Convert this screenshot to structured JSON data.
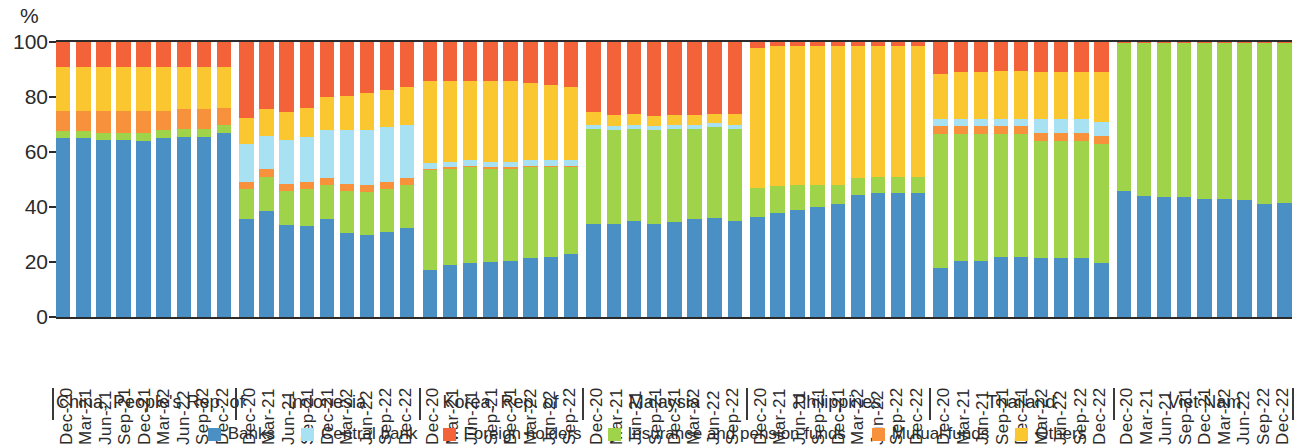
{
  "axis": {
    "unit_label": "%",
    "y_ticks": [
      0,
      20,
      40,
      60,
      80,
      100
    ],
    "y_min": 0,
    "y_max": 100
  },
  "legend": {
    "items": [
      {
        "label": "Banks",
        "color": "#4a90c4"
      },
      {
        "label": "Central bank",
        "color": "#a8e2f2"
      },
      {
        "label": "Foreign holders",
        "color": "#f4623a"
      },
      {
        "label": "Insurance and pension funds",
        "color": "#9ed34a"
      },
      {
        "label": "Mutual funds",
        "color": "#f7913c"
      },
      {
        "label": "Others",
        "color": "#fbc730"
      }
    ]
  },
  "chart_data": {
    "type": "bar",
    "subtype": "stacked-100-percent",
    "title": "",
    "xlabel": "",
    "ylabel": "%",
    "ylim": [
      0,
      100
    ],
    "grid": false,
    "legend_position": "bottom",
    "series_order": [
      "Banks",
      "Insurance and pension funds",
      "Mutual funds",
      "Central bank",
      "Others",
      "Foreign holders"
    ],
    "series_colors": {
      "Banks": "#4a90c4",
      "Central bank": "#a8e2f2",
      "Foreign holders": "#f4623a",
      "Insurance and pension funds": "#9ed34a",
      "Mutual funds": "#f7913c",
      "Others": "#fbc730"
    },
    "panels": [
      {
        "name": "China, People's Rep. of",
        "categories": [
          "Dec-20",
          "Mar-21",
          "Jun-21",
          "Sep-21",
          "Dec-21",
          "Mar-22",
          "Jun-22",
          "Sep-22",
          "Dec-22"
        ],
        "series": [
          {
            "name": "Banks",
            "values": [
              65.0,
              65.0,
              64.5,
              64.5,
              64.0,
              65.0,
              65.5,
              65.5,
              67.0
            ]
          },
          {
            "name": "Insurance and pension funds",
            "values": [
              2.5,
              2.5,
              2.5,
              2.5,
              3.0,
              3.0,
              3.0,
              3.0,
              3.0
            ]
          },
          {
            "name": "Mutual funds",
            "values": [
              0,
              0,
              0,
              0,
              0,
              0,
              0,
              0,
              0
            ]
          },
          {
            "name": "Central bank",
            "values": [
              0,
              0,
              0,
              0,
              0,
              0,
              0,
              0,
              0
            ]
          },
          {
            "name": "Others",
            "values": [
              0,
              0,
              0,
              0,
              0,
              0,
              0,
              0,
              0
            ]
          },
          {
            "name": "Foreign holders",
            "values": [
              32.5,
              32.5,
              33.0,
              33.0,
              33.0,
              32.0,
              31.5,
              31.5,
              30.0
            ]
          }
        ],
        "composite_segments": [
          {
            "name": "Banks",
            "values": [
              65.0,
              65.0,
              64.5,
              64.5,
              64.0,
              65.0,
              65.5,
              65.5,
              67.0
            ]
          },
          {
            "name": "Insurance and pension funds",
            "values": [
              2.5,
              2.5,
              2.5,
              2.5,
              3.0,
              3.0,
              3.0,
              3.0,
              3.0
            ]
          },
          {
            "name": "Mutual funds",
            "values": [
              7.5,
              7.5,
              8.0,
              8.0,
              8.0,
              7.0,
              7.0,
              7.0,
              6.0
            ]
          },
          {
            "name": "Others",
            "values": [
              16.0,
              16.0,
              16.0,
              16.0,
              16.0,
              16.0,
              15.5,
              15.5,
              15.0
            ]
          },
          {
            "name": "Foreign holders",
            "values": [
              9.0,
              9.0,
              9.0,
              9.0,
              9.0,
              9.0,
              9.0,
              9.0,
              9.0
            ]
          }
        ]
      },
      {
        "name": "Indonesia",
        "categories": [
          "Dec-20",
          "Mar-21",
          "Jun-21",
          "Sep-21",
          "Dec-21",
          "Mar-22",
          "Jun-22",
          "Sep-22",
          "Dec-22"
        ],
        "composite_segments": [
          {
            "name": "Banks",
            "values": [
              35.5,
              38.5,
              33.5,
              33.0,
              35.5,
              30.5,
              30.0,
              31.0,
              32.5
            ]
          },
          {
            "name": "Insurance and pension funds",
            "values": [
              11.0,
              12.5,
              12.5,
              13.5,
              12.5,
              15.5,
              15.5,
              15.5,
              15.5
            ]
          },
          {
            "name": "Mutual funds",
            "values": [
              2.5,
              3.0,
              2.5,
              2.5,
              2.5,
              2.5,
              2.5,
              2.5,
              2.5
            ]
          },
          {
            "name": "Central bank",
            "values": [
              14.0,
              12.0,
              16.0,
              16.5,
              17.5,
              19.5,
              20.0,
              20.0,
              19.5
            ]
          },
          {
            "name": "Others",
            "values": [
              9.5,
              9.5,
              10.0,
              10.5,
              12.0,
              12.5,
              13.5,
              13.5,
              13.5
            ]
          },
          {
            "name": "Foreign holders",
            "values": [
              27.5,
              24.5,
              25.5,
              24.0,
              20.0,
              19.5,
              18.5,
              17.5,
              16.5
            ]
          }
        ]
      },
      {
        "name": "Korea, Rep. of",
        "categories": [
          "Dec-20",
          "Mar-21",
          "Jun-21",
          "Sep-21",
          "Dec-21",
          "Mar-22",
          "Jun-22",
          "Sep-22"
        ],
        "composite_segments": [
          {
            "name": "Banks",
            "values": [
              17.0,
              19.0,
              19.5,
              20.0,
              20.5,
              21.5,
              22.0,
              23.0
            ]
          },
          {
            "name": "Insurance and pension funds",
            "values": [
              36.5,
              35.0,
              35.0,
              34.0,
              33.5,
              33.0,
              32.5,
              31.5
            ]
          },
          {
            "name": "Mutual funds",
            "values": [
              0.5,
              0.5,
              0.5,
              0.5,
              0.5,
              0.5,
              0.5,
              0.5
            ]
          },
          {
            "name": "Central bank",
            "values": [
              2.0,
              2.0,
              2.0,
              2.0,
              2.0,
              2.0,
              2.0,
              2.0
            ]
          },
          {
            "name": "Others",
            "values": [
              30.0,
              29.5,
              29.0,
              29.5,
              29.5,
              28.0,
              27.5,
              26.5
            ]
          },
          {
            "name": "Foreign holders",
            "values": [
              14.0,
              14.0,
              14.0,
              14.0,
              14.0,
              15.0,
              15.5,
              16.5
            ]
          }
        ]
      },
      {
        "name": "Malaysia",
        "categories": [
          "Dec-20",
          "Mar-21",
          "Jun-21",
          "Sep-21",
          "Dec-21",
          "Mar-22",
          "Jun-22",
          "Sep-22"
        ],
        "composite_segments": [
          {
            "name": "Banks",
            "values": [
              34.0,
              34.0,
              35.0,
              34.0,
              34.5,
              35.5,
              36.0,
              35.0
            ]
          },
          {
            "name": "Insurance and pension funds",
            "values": [
              34.5,
              34.0,
              33.5,
              34.0,
              34.0,
              33.0,
              33.0,
              33.5
            ]
          },
          {
            "name": "Mutual funds",
            "values": [
              0,
              0,
              0,
              0,
              0,
              0,
              0,
              0
            ]
          },
          {
            "name": "Central bank",
            "values": [
              1.5,
              1.5,
              1.5,
              1.5,
              1.5,
              1.5,
              1.5,
              1.5
            ]
          },
          {
            "name": "Others",
            "values": [
              4.5,
              4.0,
              4.0,
              3.5,
              3.5,
              3.5,
              3.5,
              4.0
            ]
          },
          {
            "name": "Foreign holders",
            "values": [
              25.5,
              26.5,
              26.0,
              27.0,
              26.5,
              26.5,
              26.0,
              26.0
            ]
          }
        ]
      },
      {
        "name": "Philippines",
        "categories": [
          "Dec-20",
          "Mar-21",
          "Jun-21",
          "Sep-21",
          "Dec-21",
          "Mar-22",
          "Jun-22",
          "Sep-22",
          "Dec-22"
        ],
        "composite_segments": [
          {
            "name": "Banks",
            "values": [
              36.5,
              38.0,
              39.0,
              40.0,
              41.0,
              44.5,
              45.0,
              45.0,
              45.0
            ]
          },
          {
            "name": "Insurance and pension funds",
            "values": [
              10.5,
              9.5,
              9.0,
              8.0,
              7.0,
              6.0,
              6.0,
              6.0,
              6.0
            ]
          },
          {
            "name": "Mutual funds",
            "values": [
              0,
              0,
              0,
              0,
              0,
              0,
              0,
              0,
              0
            ]
          },
          {
            "name": "Central bank",
            "values": [
              0,
              0,
              0,
              0,
              0,
              0,
              0,
              0,
              0
            ]
          },
          {
            "name": "Others",
            "values": [
              51.0,
              51.0,
              50.5,
              50.5,
              50.5,
              48.0,
              47.5,
              47.5,
              47.5
            ]
          },
          {
            "name": "Foreign holders",
            "values": [
              2.0,
              1.5,
              1.5,
              1.5,
              1.5,
              1.5,
              1.5,
              1.5,
              1.5
            ]
          }
        ]
      },
      {
        "name": "Thailand",
        "categories": [
          "Dec-20",
          "Mar-21",
          "Jun-21",
          "Sep-21",
          "Dec-21",
          "Mar-22",
          "Jun-22",
          "Sep-22",
          "Dec-22"
        ],
        "composite_segments": [
          {
            "name": "Banks",
            "values": [
              18.0,
              20.5,
              20.5,
              22.0,
              22.0,
              21.5,
              21.5,
              21.5,
              19.5
            ]
          },
          {
            "name": "Insurance and pension funds",
            "values": [
              48.5,
              46.0,
              46.0,
              44.5,
              44.5,
              42.5,
              42.5,
              42.5,
              43.5
            ]
          },
          {
            "name": "Mutual funds",
            "values": [
              3.0,
              3.0,
              3.0,
              3.0,
              3.0,
              3.0,
              3.0,
              3.0,
              3.0
            ]
          },
          {
            "name": "Central bank",
            "values": [
              2.5,
              2.5,
              2.5,
              2.5,
              2.5,
              5.0,
              5.0,
              5.0,
              5.0
            ]
          },
          {
            "name": "Others",
            "values": [
              16.5,
              17.0,
              17.0,
              17.5,
              17.5,
              17.0,
              17.0,
              17.0,
              18.0
            ]
          },
          {
            "name": "Foreign holders",
            "values": [
              11.5,
              11.0,
              11.0,
              10.5,
              10.5,
              11.0,
              11.0,
              11.0,
              11.0
            ]
          }
        ]
      },
      {
        "name": "Viet Nam",
        "categories": [
          "Dec-20",
          "Mar-21",
          "Jun-21",
          "Sep-21",
          "Dec-21",
          "Mar-22",
          "Jun-22",
          "Sep-22",
          "Dec-22"
        ],
        "composite_segments": [
          {
            "name": "Banks",
            "values": [
              46.0,
              44.0,
              43.5,
              43.5,
              43.0,
              43.0,
              42.5,
              41.0,
              41.5
            ]
          },
          {
            "name": "Insurance and pension funds",
            "values": [
              53.5,
              55.5,
              56.0,
              56.0,
              56.5,
              56.5,
              57.0,
              58.5,
              58.0
            ]
          },
          {
            "name": "Mutual funds",
            "values": [
              0,
              0,
              0,
              0,
              0,
              0,
              0,
              0,
              0
            ]
          },
          {
            "name": "Central bank",
            "values": [
              0,
              0,
              0,
              0,
              0,
              0,
              0,
              0,
              0
            ]
          },
          {
            "name": "Others",
            "values": [
              0,
              0,
              0,
              0,
              0,
              0,
              0,
              0,
              0
            ]
          },
          {
            "name": "Foreign holders",
            "values": [
              0.5,
              0.5,
              0.5,
              0.5,
              0.5,
              0.5,
              0.5,
              0.5,
              0.5
            ]
          }
        ]
      }
    ]
  }
}
